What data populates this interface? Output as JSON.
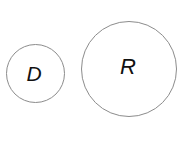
{
  "figure": {
    "background_color": "#ffffff",
    "width": 181,
    "height": 155,
    "shapes": [
      {
        "id": "circle-d",
        "kind": "circle",
        "label": "D",
        "stroke_color": "#8c8c8c",
        "fill_color": "none",
        "stroke_width": 1.6,
        "center_x": 35,
        "center_y": 73,
        "diameter": 59
      },
      {
        "id": "circle-r",
        "kind": "circle",
        "label": "R",
        "stroke_color": "#8c8c8c",
        "fill_color": "none",
        "stroke_width": 1.6,
        "center_x": 129,
        "center_y": 69,
        "diameter": 96
      }
    ]
  }
}
